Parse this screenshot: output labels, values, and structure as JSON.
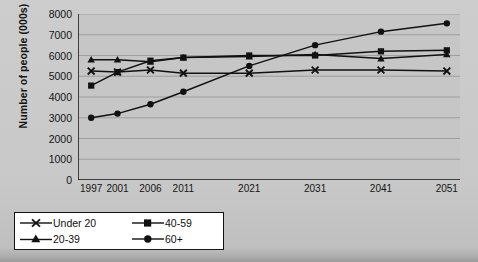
{
  "chart_data": {
    "type": "line",
    "title": "",
    "xlabel": "",
    "ylabel": "Number of people (000s)",
    "categories": [
      "1997",
      "2001",
      "2006",
      "2011",
      "2021",
      "2031",
      "2041",
      "2051"
    ],
    "x": [
      1997,
      2001,
      2006,
      2011,
      2021,
      2031,
      2041,
      2051
    ],
    "xlim": [
      1995,
      2053
    ],
    "ylim": [
      0,
      8000
    ],
    "yticks": [
      0,
      1000,
      2000,
      3000,
      4000,
      5000,
      6000,
      7000,
      8000
    ],
    "ytick_labels": [
      "0",
      "1000",
      "2000",
      "3000",
      "4000",
      "5000",
      "6000",
      "7000",
      "8000"
    ],
    "grid": true,
    "legend_position": "below-left",
    "series": [
      {
        "name": "Under 20",
        "marker": "x",
        "color": "#111111",
        "values": [
          5250,
          5200,
          5300,
          5150,
          5150,
          5300,
          5300,
          5250
        ]
      },
      {
        "name": "20-39",
        "marker": "triangle",
        "color": "#111111",
        "values": [
          5800,
          5800,
          5700,
          5900,
          5950,
          6050,
          5850,
          6050
        ]
      },
      {
        "name": "40-59",
        "marker": "square",
        "color": "#111111",
        "values": [
          4550,
          5200,
          5750,
          5900,
          6000,
          6000,
          6200,
          6250
        ]
      },
      {
        "name": "60+",
        "marker": "circle",
        "color": "#111111",
        "values": [
          3000,
          3200,
          3650,
          4250,
          5500,
          6500,
          7150,
          7550
        ]
      }
    ]
  },
  "legend": {
    "entries": [
      {
        "label": "Under 20",
        "marker": "x"
      },
      {
        "label": "40-59",
        "marker": "square"
      },
      {
        "label": "20-39",
        "marker": "triangle"
      },
      {
        "label": "60+",
        "marker": "circle"
      }
    ]
  },
  "colors": {
    "page_background": "#c9c9c9",
    "plot_background": "#c6c6c6",
    "ink": "#111111",
    "gridline": "#9a9a9a",
    "legend_background": "#ffffff"
  }
}
